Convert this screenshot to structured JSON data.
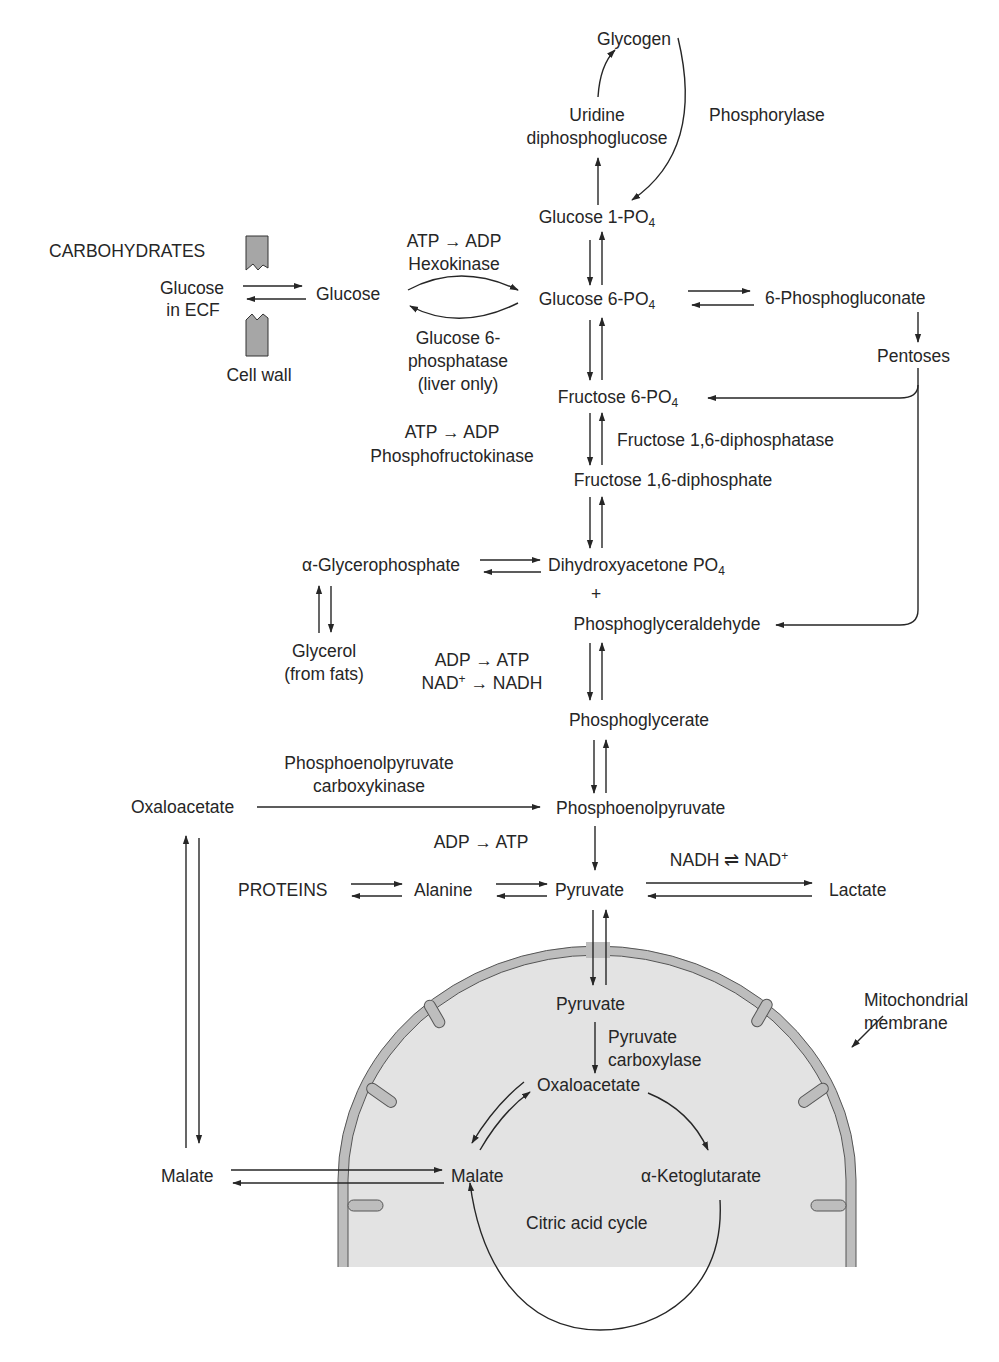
{
  "diagram": {
    "type": "metabolic-pathway",
    "colors": {
      "ink": "#262626",
      "membrane_fill": "#bdbdbd",
      "matrix_fill": "#e3e3e3",
      "wall_fill": "#a6a6a6"
    },
    "top": {
      "glycogen": "Glycogen",
      "udpg_line1": "Uridine",
      "udpg_line2": "diphosphoglucose",
      "phosphorylase": "Phosphorylase",
      "g1p": "Glucose 1-PO",
      "g1p_sub": "4"
    },
    "entry": {
      "carbohydrates": "CARBOHYDRATES",
      "glucose_ecf_line1": "Glucose",
      "glucose_ecf_line2": "in ECF",
      "cell_wall": "Cell wall",
      "glucose": "Glucose",
      "hexokinase_cofactor": "ATP → ADP",
      "hexokinase": "Hexokinase",
      "g6pase_line1": "Glucose 6-",
      "g6pase_line2": "phosphatase",
      "g6pase_line3": "(liver only)"
    },
    "pentose": {
      "g6p": "Glucose 6-PO",
      "g6p_sub": "4",
      "phosphogluconate": "6-Phosphogluconate",
      "pentoses": "Pentoses"
    },
    "glycolysis": {
      "f6p": "Fructose 6-PO",
      "f6p_sub": "4",
      "pfk_cofactor": "ATP → ADP",
      "pfk": "Phosphofructokinase",
      "fbpase": "Fructose 1,6-diphosphatase",
      "fbp": "Fructose 1,6-diphosphate",
      "dhap": "Dihydroxyacetone PO",
      "dhap_sub": "4",
      "plus": "+",
      "gap": "Phosphoglyceraldehyde",
      "glycerophosphate": "α-Glycerophosphate",
      "glycerol_line1": "Glycerol",
      "glycerol_line2": "(from fats)",
      "gapdh_cofactor1": "ADP → ATP",
      "gapdh_cofactor2_pre": "NAD",
      "gapdh_cofactor2_sup": "+",
      "gapdh_cofactor2_post": " → NADH",
      "phosphoglycerate": "Phosphoglycerate",
      "pepck_line1": "Phosphoenolpyruvate",
      "pepck_line2": "carboxykinase",
      "oxaloacetate_cyto": "Oxaloacetate",
      "pep": "Phosphoenolpyruvate",
      "pk_cofactor": "ADP → ATP",
      "proteins": "PROTEINS",
      "alanine": "Alanine",
      "pyruvate": "Pyruvate",
      "ldh_cofactor_pre": "NADH ⇌ NAD",
      "ldh_cofactor_sup": "+",
      "lactate": "Lactate",
      "malate_cyto": "Malate"
    },
    "mitochondrion": {
      "membrane_line1": "Mitochondrial",
      "membrane_line2": "membrane",
      "pyruvate": "Pyruvate",
      "pc_line1": "Pyruvate",
      "pc_line2": "carboxylase",
      "oxaloacetate": "Oxaloacetate",
      "malate": "Malate",
      "akg": "α-Ketoglutarate",
      "tca": "Citric acid cycle"
    }
  }
}
